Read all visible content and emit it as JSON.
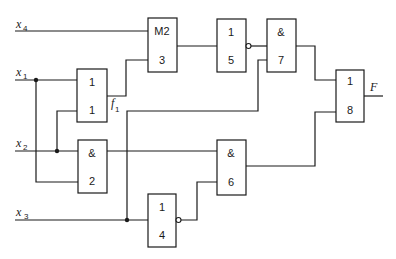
{
  "diagram": {
    "type": "logic-circuit",
    "inputs": [
      {
        "id": "x4",
        "label": "x",
        "sub": "4"
      },
      {
        "id": "x1",
        "label": "x",
        "sub": "1"
      },
      {
        "id": "x2",
        "label": "x",
        "sub": "2"
      },
      {
        "id": "x3",
        "label": "x",
        "sub": "3"
      }
    ],
    "gates": [
      {
        "id": "g1",
        "function": "1",
        "number": "1"
      },
      {
        "id": "g2",
        "function": "&",
        "number": "2"
      },
      {
        "id": "g3",
        "function": "M2",
        "number": "3"
      },
      {
        "id": "g4",
        "function": "1",
        "number": "4",
        "inverted_output": true
      },
      {
        "id": "g5",
        "function": "1",
        "number": "5",
        "inverted_output": true
      },
      {
        "id": "g6",
        "function": "&",
        "number": "6"
      },
      {
        "id": "g7",
        "function": "&",
        "number": "7"
      },
      {
        "id": "g8",
        "function": "1",
        "number": "8"
      }
    ],
    "intermediate": {
      "label": "f",
      "sub": "1"
    },
    "output": {
      "label": "F"
    },
    "connections": [
      [
        "x1",
        "g1.in1"
      ],
      [
        "x1",
        "g2.in2"
      ],
      [
        "x2",
        "g2.in1"
      ],
      [
        "x2",
        "g1.in2"
      ],
      [
        "x4",
        "g3.in1"
      ],
      [
        "g1",
        "g3.in2"
      ],
      [
        "x3",
        "g4.in1"
      ],
      [
        "x3",
        "g7.in2"
      ],
      [
        "g3",
        "g5.in1"
      ],
      [
        "g5",
        "g7.in1"
      ],
      [
        "g2",
        "g6.in1"
      ],
      [
        "g4",
        "g6.in2"
      ],
      [
        "g7",
        "g8.in1"
      ],
      [
        "g6",
        "g8.in2"
      ],
      [
        "g8",
        "F"
      ]
    ]
  }
}
